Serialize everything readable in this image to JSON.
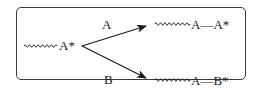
{
  "diagram": {
    "reactant": {
      "label": "A*"
    },
    "branches": [
      {
        "reagent": "A",
        "product": "A—A*"
      },
      {
        "reagent": "B",
        "product": "A—B*"
      }
    ],
    "chain_symbol": "wavy-chain",
    "colors": {
      "ink": "#1a1a1a",
      "border": "#3a3a3a"
    }
  }
}
